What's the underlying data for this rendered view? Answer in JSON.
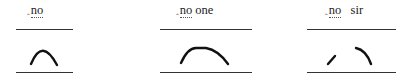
{
  "panels": [
    {
      "id": "no",
      "marker": "‸",
      "stressed": "no",
      "rest": "",
      "contour": "rise-fall"
    },
    {
      "id": "no-one",
      "marker": "‸",
      "stressed": "no",
      "rest": " one",
      "contour": "extended-rise-fall"
    },
    {
      "id": "no-sir",
      "marker": "‸",
      "stressed": "no",
      "rest": "   sir",
      "contour": "interrupted-rise-fall"
    }
  ]
}
